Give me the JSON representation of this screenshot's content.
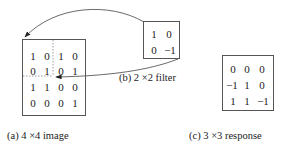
{
  "image": {
    "caption": "(a) 4 ×4 image",
    "values": [
      [
        1,
        0,
        1,
        0
      ],
      [
        0,
        1,
        0,
        1
      ],
      [
        1,
        1,
        0,
        0
      ],
      [
        0,
        0,
        0,
        1
      ]
    ]
  },
  "filter": {
    "caption": "(b) 2 ×2 filter",
    "values": [
      [
        "1",
        "0"
      ],
      [
        "0",
        "−1"
      ]
    ]
  },
  "response": {
    "caption": "(c) 3 ×3 response",
    "values": [
      [
        "0",
        "0",
        "0"
      ],
      [
        "−1",
        "1",
        "0"
      ],
      [
        "1",
        "1",
        "−1"
      ]
    ]
  },
  "colors": {
    "stroke": "#555555",
    "text": "#222222"
  }
}
